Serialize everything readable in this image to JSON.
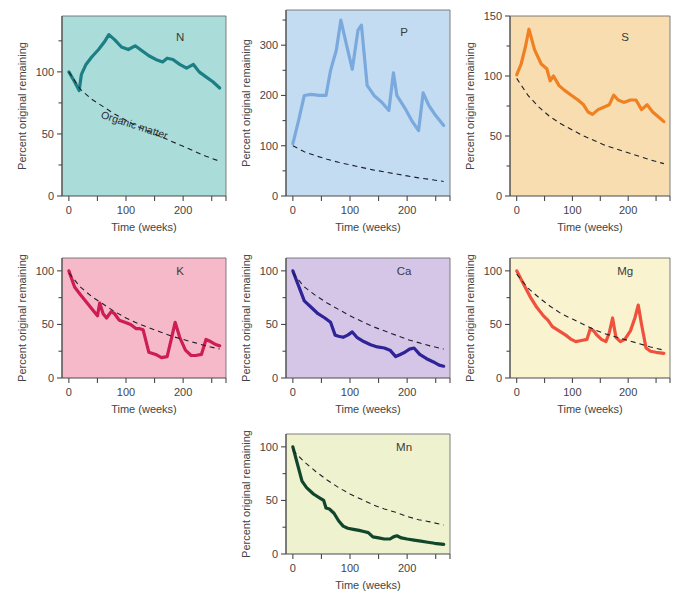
{
  "figure": {
    "axis_x_label": "Time (weeks)",
    "axis_y_label": "Percent original remaining",
    "organic_matter_label": "Organic matter"
  },
  "chart_data": [
    {
      "type": "line",
      "title": "N",
      "xlabel": "Time (weeks)",
      "ylabel": "Percent original remaining",
      "xlim": [
        -12,
        275
      ],
      "ylim": [
        0,
        145
      ],
      "xticks": [
        0,
        50,
        100,
        150,
        200,
        250
      ],
      "xticklabels": [
        "0",
        "",
        "100",
        "",
        "200",
        ""
      ],
      "yticks": [
        0,
        50,
        100
      ],
      "yticklabels": [
        "0",
        "50",
        "100"
      ],
      "grid": false,
      "legend": "none",
      "bg": "#aadcd9",
      "line_color": "#1b7f84",
      "series": [
        {
          "name": "N",
          "x": [
            0,
            10,
            18,
            22,
            30,
            40,
            52,
            62,
            70,
            80,
            92,
            104,
            116,
            128,
            140,
            152,
            164,
            172,
            182,
            194,
            206,
            218,
            228,
            240,
            252,
            264
          ],
          "values": [
            100,
            92,
            85,
            98,
            106,
            112,
            118,
            124,
            130,
            126,
            120,
            118,
            121,
            117,
            113,
            110,
            108,
            111,
            110,
            106,
            103,
            106,
            100,
            96,
            92,
            87
          ]
        },
        {
          "name": "Organic matter",
          "dashed": true,
          "x": [
            0,
            20,
            40,
            60,
            80,
            100,
            120,
            140,
            160,
            180,
            200,
            220,
            240,
            264
          ],
          "values": [
            100,
            86,
            78,
            72,
            66,
            61,
            56,
            52,
            48,
            44,
            40,
            36,
            32,
            28
          ]
        }
      ]
    },
    {
      "type": "line",
      "title": "P",
      "xlabel": "Time (weeks)",
      "ylabel": "Percent original remaining",
      "xlim": [
        -12,
        275
      ],
      "ylim": [
        0,
        370
      ],
      "xticks": [
        0,
        50,
        100,
        150,
        200,
        250
      ],
      "xticklabels": [
        "0",
        "",
        "100",
        "",
        "200",
        ""
      ],
      "yticks": [
        0,
        100,
        200,
        300
      ],
      "yticklabels": [
        "0",
        "100",
        "200",
        "300"
      ],
      "grid": false,
      "legend": "none",
      "bg": "#c4dcf2",
      "line_color": "#7aa9dd",
      "series": [
        {
          "name": "P",
          "x": [
            0,
            10,
            20,
            32,
            46,
            58,
            66,
            76,
            84,
            94,
            104,
            114,
            120,
            130,
            142,
            156,
            168,
            176,
            182,
            196,
            208,
            220,
            228,
            238,
            250,
            264
          ],
          "values": [
            104,
            150,
            200,
            202,
            200,
            200,
            250,
            290,
            350,
            300,
            252,
            330,
            340,
            220,
            200,
            186,
            170,
            245,
            200,
            175,
            150,
            130,
            205,
            180,
            160,
            140
          ]
        },
        {
          "name": "Organic matter",
          "dashed": true,
          "x": [
            0,
            20,
            40,
            60,
            80,
            100,
            120,
            140,
            160,
            180,
            200,
            220,
            240,
            264
          ],
          "values": [
            100,
            88,
            80,
            73,
            67,
            62,
            57,
            52,
            48,
            44,
            40,
            36,
            33,
            29
          ]
        }
      ]
    },
    {
      "type": "line",
      "title": "S",
      "xlabel": "Time (weeks)",
      "ylabel": "Percent original remaining",
      "xlim": [
        -12,
        275
      ],
      "ylim": [
        0,
        150
      ],
      "xticks": [
        0,
        50,
        100,
        150,
        200,
        250
      ],
      "xticklabels": [
        "0",
        "",
        "100",
        "",
        "200",
        ""
      ],
      "yticks": [
        0,
        50,
        100,
        150
      ],
      "yticklabels": [
        "0",
        "50",
        "100",
        "150"
      ],
      "grid": false,
      "legend": "none",
      "bg": "#f7ddaf",
      "line_color": "#f08022",
      "series": [
        {
          "name": "S",
          "x": [
            0,
            8,
            16,
            22,
            32,
            44,
            54,
            60,
            66,
            76,
            86,
            98,
            110,
            120,
            128,
            136,
            146,
            156,
            166,
            174,
            182,
            192,
            204,
            214,
            224,
            234,
            244,
            254,
            264
          ],
          "values": [
            101,
            110,
            125,
            139,
            122,
            110,
            106,
            96,
            100,
            92,
            88,
            84,
            80,
            76,
            70,
            68,
            72,
            74,
            76,
            84,
            80,
            78,
            80,
            80,
            72,
            76,
            70,
            66,
            62
          ]
        },
        {
          "name": "Organic matter",
          "dashed": true,
          "x": [
            0,
            20,
            40,
            60,
            80,
            100,
            120,
            140,
            160,
            180,
            200,
            220,
            240,
            264
          ],
          "values": [
            98,
            84,
            74,
            66,
            60,
            55,
            50,
            46,
            42,
            39,
            36,
            33,
            30,
            27
          ]
        }
      ]
    },
    {
      "type": "line",
      "title": "K",
      "xlabel": "Time (weeks)",
      "ylabel": "Percent original remaining",
      "xlim": [
        -12,
        275
      ],
      "ylim": [
        0,
        112
      ],
      "xticks": [
        0,
        50,
        100,
        150,
        200,
        250
      ],
      "xticklabels": [
        "0",
        "",
        "100",
        "",
        "200",
        ""
      ],
      "yticks": [
        0,
        50,
        100
      ],
      "yticklabels": [
        "0",
        "50",
        "100"
      ],
      "grid": false,
      "legend": "none",
      "bg": "#f5b9ca",
      "line_color": "#ce1d52",
      "series": [
        {
          "name": "K",
          "x": [
            0,
            10,
            20,
            32,
            44,
            50,
            54,
            60,
            66,
            74,
            80,
            88,
            98,
            108,
            118,
            124,
            130,
            140,
            152,
            162,
            172,
            180,
            186,
            194,
            204,
            214,
            222,
            232,
            240,
            248,
            258,
            264
          ],
          "values": [
            100,
            85,
            78,
            70,
            62,
            58,
            70,
            60,
            56,
            62,
            60,
            54,
            52,
            50,
            46,
            46,
            45,
            24,
            22,
            19,
            20,
            38,
            52,
            38,
            26,
            21,
            21,
            22,
            36,
            34,
            31,
            30
          ]
        },
        {
          "name": "Organic matter",
          "dashed": true,
          "x": [
            0,
            20,
            40,
            60,
            80,
            100,
            120,
            140,
            160,
            180,
            200,
            220,
            240,
            264
          ],
          "values": [
            98,
            85,
            76,
            69,
            62,
            56,
            51,
            47,
            43,
            39,
            36,
            33,
            30,
            27
          ]
        }
      ]
    },
    {
      "type": "line",
      "title": "Ca",
      "xlabel": "Time (weeks)",
      "ylabel": "Percent original remaining",
      "xlim": [
        -12,
        275
      ],
      "ylim": [
        0,
        112
      ],
      "xticks": [
        0,
        50,
        100,
        150,
        200,
        250
      ],
      "xticklabels": [
        "0",
        "",
        "100",
        "",
        "200",
        ""
      ],
      "yticks": [
        0,
        50,
        100
      ],
      "yticklabels": [
        "0",
        "50",
        "100"
      ],
      "grid": false,
      "legend": "none",
      "bg": "#d5c6e8",
      "line_color": "#2e2397",
      "series": [
        {
          "name": "Ca",
          "x": [
            0,
            10,
            20,
            32,
            44,
            56,
            66,
            74,
            80,
            88,
            96,
            104,
            112,
            124,
            136,
            148,
            160,
            170,
            180,
            188,
            196,
            204,
            212,
            222,
            234,
            246,
            256,
            264
          ],
          "values": [
            100,
            86,
            72,
            66,
            60,
            56,
            52,
            40,
            39,
            38,
            40,
            43,
            38,
            34,
            31,
            29,
            28,
            26,
            20,
            22,
            24,
            27,
            28,
            22,
            18,
            15,
            12,
            11
          ]
        },
        {
          "name": "Organic matter",
          "dashed": true,
          "x": [
            0,
            20,
            40,
            60,
            80,
            100,
            120,
            140,
            160,
            180,
            200,
            220,
            240,
            264
          ],
          "values": [
            98,
            85,
            77,
            70,
            64,
            58,
            53,
            48,
            44,
            40,
            36,
            33,
            30,
            27
          ]
        }
      ]
    },
    {
      "type": "line",
      "title": "Mg",
      "xlabel": "Time (weeks)",
      "ylabel": "Percent original remaining",
      "xlim": [
        -12,
        275
      ],
      "ylim": [
        0,
        112
      ],
      "xticks": [
        0,
        50,
        100,
        150,
        200,
        250
      ],
      "xticklabels": [
        "0",
        "",
        "100",
        "",
        "200",
        ""
      ],
      "yticks": [
        0,
        50,
        100
      ],
      "yticklabels": [
        "0",
        "50",
        "100"
      ],
      "grid": false,
      "legend": "none",
      "bg": "#faf3cf",
      "line_color": "#ef513c",
      "series": [
        {
          "name": "Mg",
          "x": [
            0,
            12,
            24,
            36,
            48,
            56,
            64,
            76,
            88,
            98,
            106,
            116,
            126,
            132,
            138,
            144,
            152,
            160,
            166,
            172,
            178,
            186,
            194,
            204,
            212,
            218,
            224,
            232,
            240,
            250,
            264
          ],
          "values": [
            100,
            88,
            76,
            66,
            58,
            54,
            48,
            44,
            40,
            36,
            34,
            35,
            36,
            46,
            44,
            40,
            36,
            34,
            42,
            56,
            38,
            34,
            36,
            44,
            56,
            68,
            50,
            28,
            25,
            24,
            23
          ]
        },
        {
          "name": "Organic matter",
          "dashed": true,
          "x": [
            0,
            20,
            40,
            60,
            80,
            100,
            120,
            140,
            160,
            180,
            200,
            220,
            240,
            264
          ],
          "values": [
            97,
            84,
            75,
            67,
            60,
            55,
            50,
            45,
            41,
            38,
            35,
            32,
            29,
            26
          ]
        }
      ]
    },
    {
      "type": "line",
      "title": "Mn",
      "xlabel": "Time (weeks)",
      "ylabel": "Percent original remaining",
      "xlim": [
        -12,
        275
      ],
      "ylim": [
        0,
        112
      ],
      "xticks": [
        0,
        50,
        100,
        150,
        200,
        250
      ],
      "xticklabels": [
        "0",
        "",
        "100",
        "",
        "200",
        ""
      ],
      "yticks": [
        0,
        50,
        100
      ],
      "yticklabels": [
        "0",
        "50",
        "100"
      ],
      "grid": false,
      "legend": "none",
      "bg": "#eff2cf",
      "line_color": "#11462c",
      "series": [
        {
          "name": "Mn",
          "x": [
            0,
            8,
            16,
            24,
            36,
            48,
            54,
            58,
            64,
            72,
            80,
            88,
            96,
            106,
            116,
            124,
            132,
            140,
            150,
            160,
            170,
            176,
            182,
            190,
            200,
            212,
            224,
            236,
            248,
            264
          ],
          "values": [
            100,
            84,
            68,
            62,
            56,
            52,
            50,
            43,
            42,
            38,
            31,
            26,
            24,
            23,
            22,
            21,
            20,
            16,
            15,
            14,
            14,
            16,
            17,
            15,
            14,
            13,
            12,
            11,
            10,
            9
          ]
        },
        {
          "name": "Organic matter",
          "dashed": true,
          "x": [
            0,
            20,
            40,
            60,
            80,
            100,
            120,
            140,
            160,
            180,
            200,
            220,
            240,
            264
          ],
          "values": [
            97,
            86,
            77,
            69,
            62,
            56,
            51,
            46,
            42,
            39,
            35,
            32,
            30,
            27
          ]
        }
      ]
    }
  ],
  "panel_layout": [
    {
      "key": "N",
      "left": 14,
      "top": 6,
      "w": 218,
      "h": 232,
      "show_om_label": true
    },
    {
      "key": "P",
      "left": 238,
      "top": 0,
      "w": 218,
      "h": 238,
      "show_om_label": false
    },
    {
      "key": "S",
      "left": 462,
      "top": 6,
      "w": 214,
      "h": 232,
      "show_om_label": false
    },
    {
      "key": "K",
      "left": 14,
      "top": 248,
      "w": 218,
      "h": 172,
      "show_om_label": false
    },
    {
      "key": "Ca",
      "left": 238,
      "top": 248,
      "w": 218,
      "h": 172,
      "show_om_label": false
    },
    {
      "key": "Mg",
      "left": 462,
      "top": 248,
      "w": 214,
      "h": 172,
      "show_om_label": false
    },
    {
      "key": "Mn",
      "left": 238,
      "top": 424,
      "w": 218,
      "h": 172,
      "show_om_label": false
    }
  ]
}
